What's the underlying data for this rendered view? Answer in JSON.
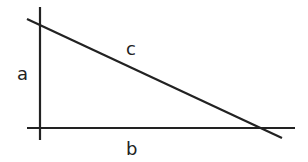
{
  "diagram": {
    "type": "right-triangle",
    "line_color": "#222222",
    "labels": {
      "a": "a",
      "b": "b",
      "c": "c"
    },
    "lines": {
      "vertical_a": {
        "x1": 40,
        "y1": 7,
        "x2": 40,
        "y2": 140
      },
      "horizontal_b": {
        "x1": 27,
        "y1": 128,
        "x2": 295,
        "y2": 128
      },
      "hypotenuse_c": {
        "x1": 27,
        "y1": 19,
        "x2": 282,
        "y2": 138
      }
    }
  }
}
